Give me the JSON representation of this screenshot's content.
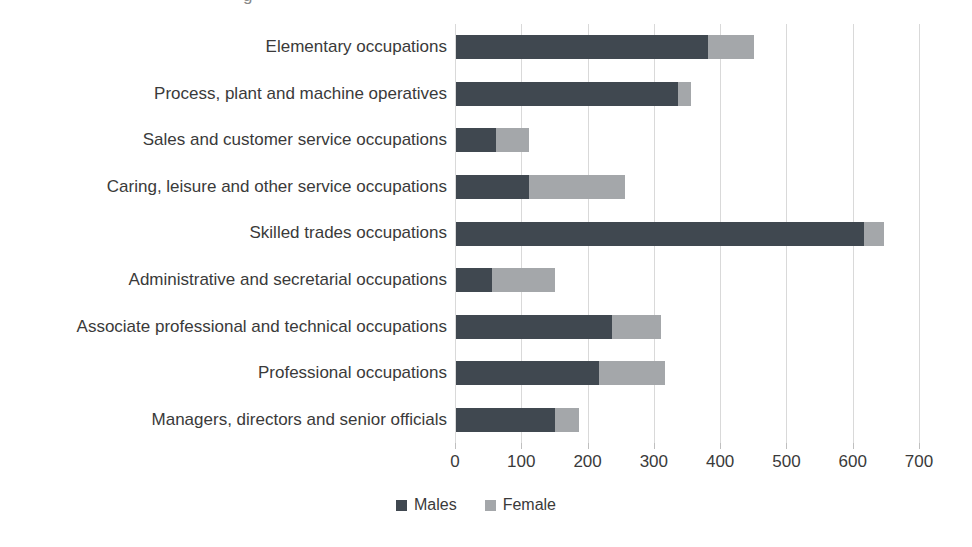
{
  "fragment": {
    "text": "g"
  },
  "chart_data": {
    "type": "bar",
    "orientation": "horizontal",
    "stacked": true,
    "title": "",
    "xlabel": "",
    "ylabel": "",
    "categories": [
      "Elementary occupations",
      "Process, plant and machine operatives",
      "Sales and customer service occupations",
      "Caring, leisure and other service occupations",
      "Skilled trades occupations",
      "Administrative and secretarial occupations",
      "Associate professional and technical occupations",
      "Professional occupations",
      "Managers, directors and senior officials"
    ],
    "series": [
      {
        "name": "Males",
        "color": "#404850",
        "values": [
          380,
          335,
          60,
          110,
          615,
          55,
          235,
          215,
          150
        ]
      },
      {
        "name": "Female",
        "color": "#a4a7aa",
        "values": [
          70,
          20,
          50,
          145,
          30,
          95,
          75,
          100,
          35
        ]
      }
    ],
    "x_ticks": [
      "0",
      "100",
      "200",
      "300",
      "400",
      "500",
      "600",
      "700"
    ],
    "xlim": [
      0,
      700
    ],
    "grid": "vertical",
    "gridline_color": "#d9d9d9",
    "legend_position": "bottom"
  }
}
